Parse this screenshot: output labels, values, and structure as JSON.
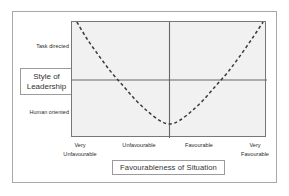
{
  "figure": {
    "background_color": "#ffffff",
    "frame_color": "#a8a8a8",
    "plot_background_color": "#f1f1f1",
    "plot_border_color": "#777777",
    "curve_color": "#3a3a3a",
    "axis_line_color": "#666666",
    "label_color": "#2b2b2b"
  },
  "chart_data": {
    "type": "line",
    "title": "",
    "xlabel": "Favourableness of Situation",
    "ylabel": "Style of Leadership",
    "x_tick_labels": [
      "Very Unfavourable",
      "Unfavourable",
      "Favourable",
      "Very Favourable"
    ],
    "y_tick_labels": [
      "Task directed",
      "Human oriented"
    ],
    "xlim": [
      0,
      4
    ],
    "ylim": [
      0,
      1
    ],
    "grid": false,
    "legend": null,
    "axis_cross_x": 2.0,
    "axis_cross_y": 0.5,
    "series": [
      {
        "name": "Effective leadership style",
        "style": "dashed",
        "x": [
          0.1,
          0.3,
          0.55,
          0.8,
          1.05,
          1.3,
          1.55,
          1.8,
          2.0,
          2.2,
          2.45,
          2.7,
          2.95,
          3.2,
          3.45,
          3.7,
          3.92
        ],
        "y": [
          1.0,
          0.86,
          0.71,
          0.57,
          0.45,
          0.33,
          0.23,
          0.15,
          0.12,
          0.15,
          0.23,
          0.33,
          0.45,
          0.57,
          0.71,
          0.86,
          1.0
        ]
      }
    ]
  },
  "y_labels": {
    "top": "Task directed",
    "bottom": "Human oriented"
  },
  "y_axis_title": {
    "line1": "Style of",
    "line2": "Leadership"
  },
  "x_labels": [
    {
      "line1": "Very",
      "line2": "Unfavourable"
    },
    {
      "line1": "Unfavourable",
      "line2": ""
    },
    {
      "line1": "Favourable",
      "line2": ""
    },
    {
      "line1": "Very",
      "line2": "Favourable"
    }
  ],
  "x_axis_title": {
    "text": "Favourableness of Situation"
  }
}
